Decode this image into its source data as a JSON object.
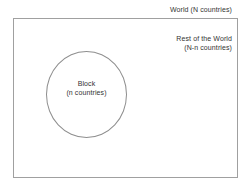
{
  "diagram": {
    "outer_region": {
      "name": "world",
      "label": "World (N countries)",
      "shape": "rectangle",
      "border_color": "#a0a0a0"
    },
    "inner_region": {
      "name": "block",
      "label_line1": "Block",
      "label_line2": "(n countries)",
      "shape": "circle",
      "border_color": "#8e8e8e"
    },
    "complement_region": {
      "name": "rest-of-the-world",
      "label_line1": "Rest of the World",
      "label_line2": "(N-n countries)"
    },
    "colors": {
      "background": "#ffffff",
      "text": "#333333",
      "rect_stroke": "#a0a0a0",
      "circle_stroke": "#8e8e8e"
    }
  }
}
